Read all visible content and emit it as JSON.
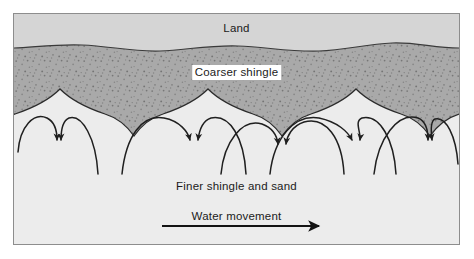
{
  "diagram": {
    "title_text": "Land",
    "labels": {
      "land": "Land",
      "coarser_shingle": "Coarser shingle",
      "finer_shingle": "Finer shingle and sand",
      "water_movement": "Water movement"
    },
    "colors": {
      "land_band": "#d5d5d5",
      "coarser_shingle_band": "#a9a9a9",
      "shingle_speckle": "#7d7d7d",
      "finer_shingle_area": "#ececec",
      "outline": "#2b2b2b",
      "frame_border": "#8d8d8d",
      "label_text": "#1b1b1b",
      "label_highlight_bg": "#ffffff",
      "page_background": "#ffffff"
    },
    "icons": {
      "water_movement_arrow": "right-arrow-icon",
      "swash_arrow": "curved-arrow-icon"
    },
    "geometry": {
      "frame": {
        "x": 13,
        "y": 13,
        "width": 447,
        "height": 232
      },
      "land_shingle_boundary_y_avg": 33,
      "cusp_count": 5,
      "swash_arrow_pair_count": 5,
      "water_arrow": {
        "x1": 160,
        "y1": 218,
        "x2": 310,
        "y2": 218
      }
    }
  }
}
